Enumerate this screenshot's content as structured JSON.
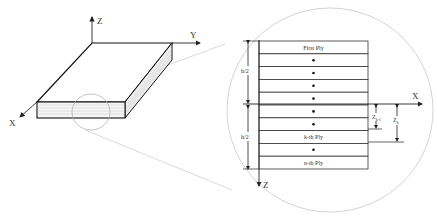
{
  "left_figure": {
    "axes": {
      "z": "Z",
      "y": "Y",
      "x": "X"
    }
  },
  "right_figure": {
    "plies": [
      {
        "label": "First Ply",
        "dot": false
      },
      {
        "label": "",
        "dot": true
      },
      {
        "label": "",
        "dot": true
      },
      {
        "label": "",
        "dot": true
      },
      {
        "label": "",
        "dot": true
      },
      {
        "label": "",
        "dot": true
      },
      {
        "label": "",
        "dot": true
      },
      {
        "label": "k-th Ply",
        "dot": false
      },
      {
        "label": "",
        "dot": true
      },
      {
        "label": "n-th Ply",
        "dot": false
      }
    ],
    "axes": {
      "x": "X",
      "z": "Z"
    },
    "dimensions": {
      "upper_half": "h/2",
      "lower_half": "h/2",
      "z_k_minus_1": "Z",
      "z_k_minus_1_sub": "k-1",
      "z_k": "Z",
      "z_k_sub": "k"
    }
  }
}
